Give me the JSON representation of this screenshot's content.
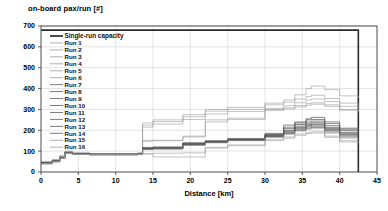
{
  "chart_data": {
    "type": "line",
    "title": "on-board pax/run [#]",
    "xlabel": "Distance [km]",
    "ylabel": "",
    "xlim": [
      0,
      45
    ],
    "ylim": [
      0,
      700
    ],
    "xticks": [
      0,
      5,
      10,
      15,
      20,
      25,
      30,
      35,
      40,
      45
    ],
    "yticks": [
      0,
      100,
      200,
      300,
      400,
      500,
      600,
      700
    ],
    "grid": true,
    "legend_position": "upper-left inside",
    "legend": [
      "Single-run capacity",
      "Run 1",
      "Run 2",
      "Run 3",
      "Run 4",
      "Run 5",
      "Run 6",
      "Run 7",
      "Run 8",
      "Run 9",
      "Run 10",
      "Run 11",
      "Run 12",
      "Run 13",
      "Run 14",
      "Run 15",
      "Run 16"
    ],
    "colors": {
      "capacity": "#2b2b2b",
      "runs_light": "#9a9a9a",
      "runs_dark": "#585858",
      "grid": "#c8c8c8",
      "frame": "#3a3a3a"
    },
    "series": [
      {
        "name": "Single-run capacity",
        "style": "step",
        "x": [
          0,
          42.5,
          42.5
        ],
        "values": [
          680,
          680,
          0
        ]
      },
      {
        "name": "Run 1",
        "style": "step",
        "x": [
          0,
          1.5,
          2.5,
          3.2,
          4.2,
          6.5,
          13,
          13.6,
          15,
          19,
          22,
          25,
          30,
          32.5,
          34,
          35.5,
          36.2,
          38,
          40,
          42.5
        ],
        "values": [
          50,
          60,
          78,
          100,
          92,
          88,
          92,
          235,
          250,
          275,
          300,
          310,
          330,
          345,
          370,
          400,
          412,
          395,
          365,
          355
        ]
      },
      {
        "name": "Run 2",
        "style": "step",
        "x": [
          0,
          1.5,
          2.5,
          3.2,
          4.2,
          6.5,
          13,
          13.6,
          15,
          19,
          22,
          25,
          30,
          32.5,
          34,
          35.5,
          36.2,
          38,
          40,
          42.5
        ],
        "values": [
          48,
          58,
          76,
          98,
          90,
          87,
          90,
          225,
          242,
          265,
          292,
          300,
          322,
          335,
          350,
          362,
          368,
          352,
          330,
          318
        ]
      },
      {
        "name": "Run 3",
        "style": "step",
        "x": [
          0,
          1.5,
          2.5,
          3.2,
          4.2,
          6.5,
          13,
          13.6,
          15,
          19,
          22,
          25,
          30,
          32.5,
          34,
          35.5,
          36.2,
          38,
          40,
          42.5
        ],
        "values": [
          46,
          56,
          74,
          96,
          90,
          86,
          90,
          215,
          230,
          252,
          278,
          290,
          305,
          318,
          332,
          345,
          350,
          338,
          315,
          302
        ]
      },
      {
        "name": "Run 4",
        "style": "step",
        "x": [
          0,
          1.5,
          2.5,
          3.2,
          4.2,
          6.5,
          13,
          13.6,
          15,
          19,
          22,
          25,
          30,
          32.5,
          34,
          35.5,
          36.2,
          38,
          40,
          42.5
        ],
        "values": [
          45,
          55,
          72,
          95,
          89,
          86,
          89,
          150,
          152,
          172,
          250,
          258,
          300,
          308,
          318,
          328,
          332,
          322,
          300,
          290
        ]
      },
      {
        "name": "Run 5",
        "style": "step",
        "x": [
          0,
          1.5,
          2.5,
          3.2,
          4.2,
          6.5,
          13,
          13.6,
          15,
          19,
          22,
          25,
          30,
          32.5,
          34,
          35.5,
          36.2,
          38,
          40,
          42.5
        ],
        "values": [
          44,
          54,
          71,
          94,
          88,
          85,
          88,
          148,
          150,
          168,
          240,
          252,
          295,
          302,
          312,
          320,
          325,
          315,
          296,
          285
        ]
      },
      {
        "name": "Run 6",
        "style": "step",
        "x": [
          0,
          1.5,
          2.5,
          3.2,
          4.2,
          6.5,
          13,
          13.6,
          15,
          19,
          22,
          25,
          30,
          32.5,
          34,
          35.5,
          36.2,
          38,
          40,
          42.5
        ],
        "values": [
          44,
          53,
          70,
          94,
          88,
          85,
          88,
          118,
          120,
          140,
          150,
          160,
          185,
          215,
          235,
          255,
          262,
          240,
          210,
          205
        ]
      },
      {
        "name": "Run 7",
        "style": "step",
        "x": [
          0,
          1.5,
          2.5,
          3.2,
          4.2,
          6.5,
          13,
          13.6,
          15,
          19,
          22,
          25,
          30,
          32.5,
          34,
          35.5,
          36.2,
          38,
          40,
          42.5
        ],
        "values": [
          43,
          53,
          70,
          93,
          88,
          85,
          88,
          115,
          118,
          138,
          148,
          158,
          180,
          225,
          240,
          250,
          252,
          232,
          205,
          200
        ]
      },
      {
        "name": "Run 8",
        "style": "step",
        "x": [
          0,
          1.5,
          2.5,
          3.2,
          4.2,
          6.5,
          13,
          13.6,
          15,
          19,
          22,
          25,
          30,
          32.5,
          34,
          35.5,
          36.2,
          38,
          40,
          42.5
        ],
        "values": [
          43,
          52,
          69,
          93,
          87,
          85,
          88,
          113,
          116,
          136,
          146,
          156,
          178,
          208,
          228,
          240,
          244,
          222,
          198,
          192
        ]
      },
      {
        "name": "Run 9",
        "style": "step",
        "x": [
          0,
          1.5,
          2.5,
          3.2,
          4.2,
          6.5,
          13,
          13.6,
          15,
          19,
          22,
          25,
          30,
          32.5,
          34,
          35.5,
          36.2,
          38,
          40,
          42.5
        ],
        "values": [
          42,
          52,
          69,
          92,
          87,
          84,
          87,
          112,
          115,
          134,
          145,
          155,
          176,
          200,
          220,
          232,
          236,
          214,
          190,
          186
        ]
      },
      {
        "name": "Run 10",
        "style": "step",
        "x": [
          0,
          1.5,
          2.5,
          3.2,
          4.2,
          6.5,
          13,
          13.6,
          15,
          19,
          22,
          25,
          30,
          32.5,
          34,
          35.5,
          36.2,
          38,
          40,
          42.5
        ],
        "values": [
          42,
          51,
          68,
          92,
          87,
          84,
          87,
          111,
          114,
          133,
          144,
          154,
          174,
          196,
          214,
          226,
          230,
          208,
          184,
          180
        ]
      },
      {
        "name": "Run 11",
        "style": "step",
        "x": [
          0,
          1.5,
          2.5,
          3.2,
          4.2,
          6.5,
          13,
          13.6,
          15,
          19,
          22,
          25,
          30,
          32.5,
          34,
          35.5,
          36.2,
          38,
          40,
          42.5
        ],
        "values": [
          41,
          51,
          68,
          92,
          86,
          84,
          87,
          110,
          113,
          132,
          143,
          153,
          172,
          192,
          210,
          222,
          226,
          204,
          180,
          176
        ]
      },
      {
        "name": "Run 12",
        "style": "step",
        "x": [
          0,
          1.5,
          2.5,
          3.2,
          4.2,
          6.5,
          13,
          13.6,
          15,
          19,
          22,
          25,
          30,
          32.5,
          34,
          35.5,
          36.2,
          38,
          40,
          42.5
        ],
        "values": [
          41,
          50,
          67,
          91,
          86,
          83,
          86,
          109,
          112,
          130,
          142,
          152,
          170,
          188,
          205,
          216,
          220,
          198,
          174,
          170
        ]
      },
      {
        "name": "Run 13",
        "style": "step",
        "x": [
          0,
          1.5,
          2.5,
          3.2,
          4.2,
          6.5,
          13,
          13.6,
          15,
          19,
          22,
          25,
          30,
          32.5,
          34,
          35.5,
          36.2,
          38,
          40,
          42.5
        ],
        "values": [
          40,
          50,
          67,
          91,
          86,
          83,
          86,
          108,
          111,
          129,
          141,
          151,
          168,
          184,
          200,
          210,
          214,
          192,
          168,
          164
        ]
      },
      {
        "name": "Run 14",
        "style": "step",
        "x": [
          0,
          1.5,
          2.5,
          3.2,
          4.2,
          6.5,
          13,
          13.6,
          15,
          19,
          22,
          25,
          30,
          32.5,
          34,
          35.5,
          36.2,
          38,
          40,
          42.5
        ],
        "values": [
          40,
          49,
          66,
          90,
          85,
          83,
          86,
          107,
          110,
          128,
          140,
          150,
          166,
          180,
          196,
          205,
          208,
          186,
          162,
          158
        ]
      },
      {
        "name": "Run 15",
        "style": "step",
        "x": [
          0,
          1.5,
          2.5,
          3.2,
          4.2,
          6.5,
          13,
          13.6,
          15,
          19,
          22,
          25,
          30,
          32.5,
          34,
          35.5,
          36.2,
          38,
          40,
          42.5
        ],
        "values": [
          40,
          49,
          66,
          90,
          85,
          82,
          85,
          88,
          90,
          92,
          118,
          130,
          155,
          168,
          182,
          190,
          193,
          172,
          150,
          146
        ]
      },
      {
        "name": "Run 16",
        "style": "step",
        "x": [
          0,
          1.5,
          2.5,
          3.2,
          4.2,
          6.5,
          13,
          13.6,
          15,
          19,
          22,
          25,
          30,
          32.5,
          34,
          35.5,
          36.2,
          38,
          40,
          42.5
        ],
        "values": [
          39,
          48,
          65,
          89,
          84,
          82,
          85,
          86,
          72,
          72,
          115,
          126,
          150,
          162,
          176,
          184,
          187,
          166,
          144,
          140
        ]
      }
    ]
  }
}
